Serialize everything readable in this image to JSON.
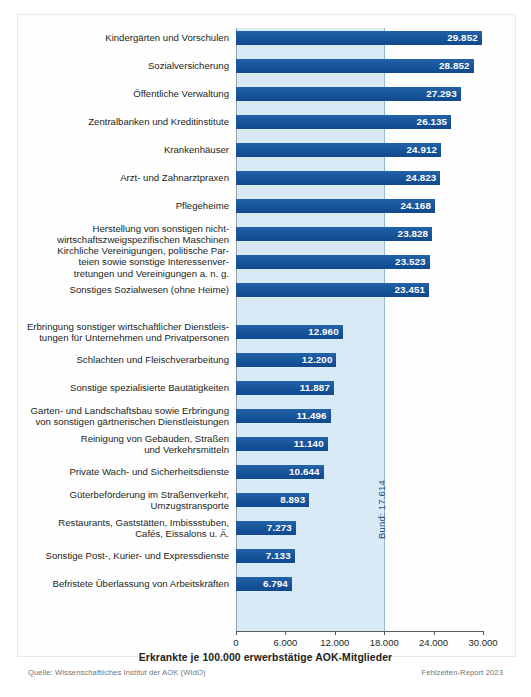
{
  "meta": {
    "source_note": "Quelle: Wissenschaftliches Institut der AOK (WIdO)",
    "report_note": "Fehlzeiten-Report 2023"
  },
  "reference": {
    "label": "Bund: 17.614",
    "value": 17614
  },
  "chart_data": {
    "type": "bar",
    "orientation": "horizontal",
    "title": "",
    "xlabel": "Erkrankte je 100.000 erwerbstätige AOK-Mitglieder",
    "ylabel": "",
    "xlim": [
      0,
      30000
    ],
    "grid": false,
    "legend": "none",
    "xticks": [
      0,
      6000,
      12000,
      18000,
      24000,
      30000
    ],
    "xticklabels": [
      "0",
      "6.000",
      "12.000",
      "18.000",
      "24.000",
      "30.000"
    ],
    "reference_line": {
      "name": "Bund",
      "value": 17614,
      "label": "Bund: 17.614"
    },
    "categories": [
      "Kindergärten und Vorschulen",
      "Sozialversicherung",
      "Öffentliche Verwaltung",
      "Zentralbanken und Kreditinstitute",
      "Krankenhäuser",
      "Arzt- und Zahnarztpraxen",
      "Pflegeheime",
      "Herstellung von sonstigen nicht-\nwirtschaftszweigspezifischen Maschinen",
      "Kirchliche Vereinigungen, politische Par-\nteien sowie sonstige Interessenver-\ntretungen und Vereinigungen a. n. g.",
      "Sonstiges Sozialwesen (ohne Heime)",
      "Erbringung sonstiger wirtschaftlicher Dienstleis-\ntungen für Unternehmen und Privatpersonen",
      "Schlachten und Fleischverarbeitung",
      "Sonstige spezialisierte Bautätigkeiten",
      "Garten- und Landschaftsbau sowie Erbringung\nvon sonstigen gärtnerischen Dienstleistungen",
      "Reinigung von Gebäuden, Straßen\nund Verkehrsmitteln",
      "Private Wach- und Sicherheitsdienste",
      "Güterbeförderung im Straßenverkehr,\nUmzugstransporte",
      "Restaurants, Gaststätten, Imbissstuben,\nCafés, Eissalons u. Ä.",
      "Sonstige Post-, Kurier- und Expressdienste",
      "Befristete Überlassung von Arbeitskräften"
    ],
    "values": [
      29852,
      28852,
      27293,
      26135,
      24912,
      24823,
      24168,
      23828,
      23523,
      23451,
      12960,
      12200,
      11887,
      11496,
      11140,
      10644,
      8893,
      7273,
      7133,
      6794
    ],
    "value_labels": [
      "29.852",
      "28.852",
      "27.293",
      "26.135",
      "24.912",
      "24.823",
      "24.168",
      "23.828",
      "23.523",
      "23.451",
      "12.960",
      "12.200",
      "11.887",
      "11.496",
      "11.140",
      "10.644",
      "8.893",
      "7.273",
      "7.133",
      "6.794"
    ],
    "groups": [
      {
        "name": "Top 10 (höchste Werte)",
        "start": 0,
        "end": 9
      },
      {
        "name": "Bottom 10 (niedrigste Werte)",
        "start": 10,
        "end": 19
      }
    ],
    "colors": {
      "bar": "#1b5ba0",
      "band": "#d7eaf5",
      "value_text": "#ffffff",
      "axis": "#5a5a5a",
      "reference_text": "#1f4f86"
    }
  }
}
